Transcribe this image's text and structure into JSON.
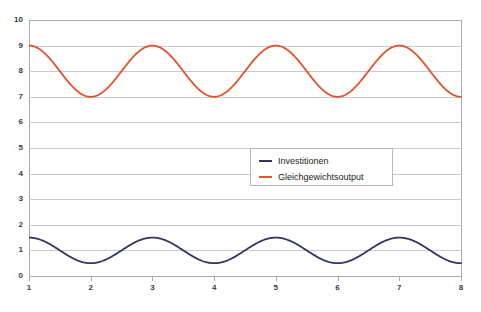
{
  "chart_data": {
    "type": "line",
    "title": "",
    "xlabel": "",
    "ylabel": "",
    "xlim": [
      1,
      8
    ],
    "ylim": [
      0,
      10
    ],
    "grid": true,
    "legend_position": "center-right-inside",
    "x_ticks": [
      "1",
      "2",
      "3",
      "4",
      "5",
      "6",
      "7",
      "8"
    ],
    "y_ticks": [
      "0",
      "1",
      "2",
      "3",
      "4",
      "5",
      "6",
      "7",
      "8",
      "9",
      "10"
    ],
    "x": [
      1,
      1.25,
      1.5,
      1.75,
      2,
      2.25,
      2.5,
      2.75,
      3,
      3.25,
      3.5,
      3.75,
      4,
      4.25,
      4.5,
      4.75,
      5,
      5.25,
      5.5,
      5.75,
      6,
      6.25,
      6.5,
      6.75,
      7,
      7.25,
      7.5,
      7.75,
      8
    ],
    "series": [
      {
        "name": "Investitionen",
        "color": "#333366",
        "amplitude": 0.5,
        "offset": 1.0,
        "period": 2,
        "min": 0.5,
        "max": 1.5,
        "values": [
          1.5,
          1.354,
          1.0,
          0.646,
          0.5,
          0.646,
          1.0,
          1.354,
          1.5,
          1.354,
          1.0,
          0.646,
          0.5,
          0.646,
          1.0,
          1.354,
          1.5,
          1.354,
          1.0,
          0.646,
          0.5,
          0.646,
          1.0,
          1.354,
          1.5,
          1.354,
          1.0,
          0.646,
          0.5
        ]
      },
      {
        "name": "Gleichgewichtsoutput",
        "color": "#E8502A",
        "amplitude": 1.0,
        "offset": 8.0,
        "period": 2,
        "min": 7,
        "max": 9,
        "values": [
          9.0,
          8.707,
          8.0,
          7.293,
          7.0,
          7.293,
          8.0,
          8.707,
          9.0,
          8.707,
          8.0,
          7.293,
          7.0,
          7.293,
          8.0,
          8.707,
          9.0,
          8.707,
          8.0,
          7.293,
          7.0,
          7.293,
          8.0,
          8.707,
          9.0,
          8.707,
          8.0,
          7.293,
          7.0
        ]
      }
    ]
  },
  "legend": {
    "items": [
      {
        "label": "Investitionen",
        "color": "#333366"
      },
      {
        "label": "Gleichgewichtsoutput",
        "color": "#E8502A"
      }
    ]
  },
  "title_fragment": "",
  "colors": {
    "axis": "#a9a9b2",
    "grid": "#c9c9d0",
    "tick_text": "#3b3b44",
    "legend_border": "#b6b6bf",
    "background": "#ffffff"
  }
}
